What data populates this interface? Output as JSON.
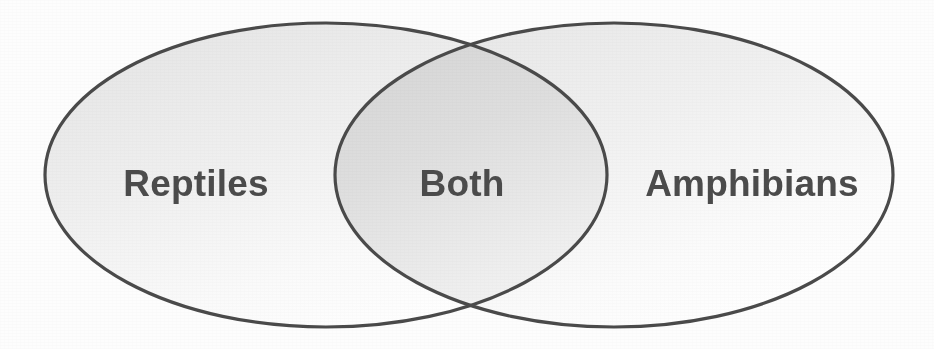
{
  "diagram": {
    "type": "venn-2-set",
    "width": 934,
    "height": 349,
    "background_color": "#fdfdfd",
    "stroke_color": "#4a4a4a",
    "stroke_width": 3,
    "label_color": "#4b4b4b",
    "fill_light": "#f4f4f4",
    "fill_mid": "#e2e2e2",
    "fill_overlap": "#dcdcdc"
  },
  "sets": [
    {
      "id": "left",
      "label": "Reptiles",
      "region": "left-only",
      "label_x": 196,
      "label_y": 184,
      "cx": 326,
      "cy": 175,
      "rx": 281,
      "ry": 152
    },
    {
      "id": "right",
      "label": "Amphibians",
      "region": "right-only",
      "label_x": 752,
      "label_y": 184,
      "cx": 614,
      "cy": 175,
      "rx": 279,
      "ry": 152
    }
  ],
  "intersection": {
    "id": "overlap",
    "label": "Both",
    "region": "intersection",
    "label_x": 462,
    "label_y": 184,
    "crossing_top": {
      "x": 470,
      "y": 46
    },
    "crossing_bottom": {
      "x": 470,
      "y": 310
    }
  }
}
